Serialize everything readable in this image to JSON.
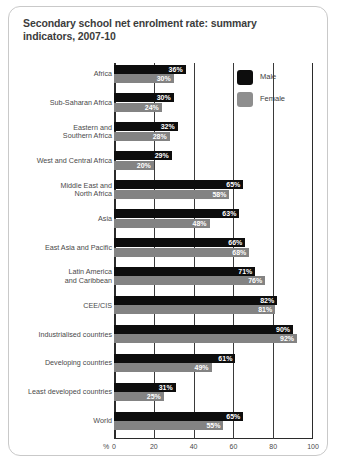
{
  "chart_data": {
    "type": "bar",
    "title": "Secondary school net enrolment rate: summary indicators, 2007-10",
    "xlabel": "%",
    "ylabel": "",
    "orientation": "horizontal",
    "xlim": [
      0,
      100
    ],
    "xticks": [
      0,
      20,
      40,
      60,
      80,
      100
    ],
    "grid": true,
    "legend_position": "top-right",
    "categories": [
      "Africa",
      "Sub-Saharan Africa",
      "Eastern and\nSouthern Africa",
      "West and Central Africa",
      "Middle East and\nNorth Africa",
      "Asia",
      "East Asia and Pacific",
      "Latin America\nand Caribbean",
      "CEE/CIS",
      "Industrialised countries",
      "Developing countries",
      "Least developed countries",
      "World"
    ],
    "series": [
      {
        "name": "Male",
        "color": "#0d0d0d",
        "values": [
          36,
          30,
          32,
          29,
          65,
          63,
          66,
          71,
          82,
          90,
          61,
          31,
          65
        ],
        "labels": [
          "36%",
          "30%",
          "32%",
          "29%",
          "65%",
          "63%",
          "66%",
          "71%",
          "82%",
          "90%",
          "61%",
          "31%",
          "65%"
        ]
      },
      {
        "name": "Female",
        "color": "#838383",
        "values": [
          30,
          24,
          28,
          20,
          58,
          48,
          68,
          76,
          81,
          92,
          49,
          25,
          55
        ],
        "labels": [
          "30%",
          "24%",
          "28%",
          "20%",
          "58%",
          "48%",
          "68%",
          "76%",
          "81%",
          "92%",
          "49%",
          "25%",
          "55%"
        ]
      }
    ]
  },
  "legend": {
    "items": [
      {
        "label": "Male",
        "color": "#0d0d0d"
      },
      {
        "label": "Female",
        "color": "#8e8e8e"
      }
    ]
  }
}
